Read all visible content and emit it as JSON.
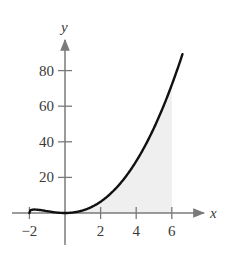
{
  "chart_data": {
    "type": "area",
    "title": "",
    "function": "y = x^2 * cbrt(x + 2)",
    "xlabel": "x",
    "ylabel": "y",
    "xlim": [
      -2.3,
      7.7
    ],
    "ylim": [
      -8,
      100
    ],
    "x_ticks": [
      -2,
      2,
      4,
      6
    ],
    "x_tick_labels": [
      "−2",
      "2",
      "4",
      "6"
    ],
    "y_ticks": [
      20,
      40,
      60,
      80
    ],
    "y_tick_labels": [
      "20",
      "40",
      "60",
      "80"
    ],
    "grid": false,
    "legend": null,
    "curve_domain": [
      -2,
      6.6
    ],
    "shaded_region": {
      "from": 0,
      "to": 6,
      "description": "area under curve between x=0 and x=6"
    },
    "x": [
      -2,
      -1.5,
      -1,
      -0.5,
      0,
      1,
      2,
      3,
      4,
      5,
      6,
      6.6
    ],
    "series": [
      {
        "name": "f(x)",
        "values": [
          0,
          1.79,
          1.0,
          0.29,
          0,
          1.44,
          6.35,
          15.39,
          29.07,
          47.82,
          72.0,
          89.3
        ]
      }
    ],
    "colors": {
      "curve": "#111111",
      "axes": "#7a7a7a",
      "shade": "#efefef"
    }
  }
}
